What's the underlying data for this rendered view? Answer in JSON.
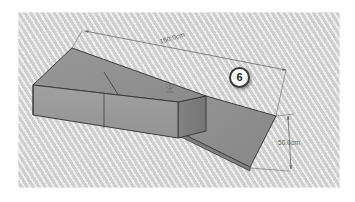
{
  "canvas": {
    "width": 355,
    "height": 202,
    "background_color": "#ffffff",
    "panel_color": "#d9d9d9",
    "panel_stripe_color": "#c4c4c4"
  },
  "diagram": {
    "projection": "isometric",
    "shape_name": "stepped-block",
    "colors": {
      "top_face": "#919191",
      "front_face": "#9a9a9a",
      "side_face": "#7c7c7c",
      "low_top_face": "#8e8e8e",
      "edge": "#3c3c3c",
      "dimension_line": "#6b6b6b",
      "label_text": "#5e5e5e",
      "badge_fill": "#fdfdfd",
      "badge_ring": "#3a3a3a"
    }
  },
  "dimensions": [
    {
      "id": "length",
      "label": "150.0cm",
      "value": 150.0,
      "unit": "cm",
      "axis": "length"
    },
    {
      "id": "height",
      "label": "50.0cm",
      "value": 50.0,
      "unit": "cm",
      "axis": "depth"
    }
  ],
  "badge": {
    "label": "6",
    "name": "step-number-badge"
  },
  "marker": {
    "name": "face-marker-icon"
  }
}
